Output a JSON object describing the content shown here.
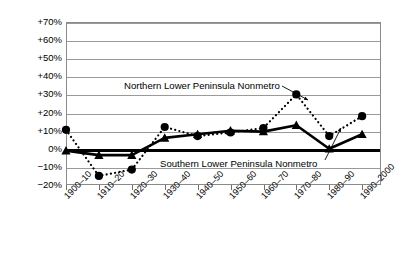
{
  "chart_data": {
    "type": "line",
    "title": "",
    "xlabel": "",
    "ylabel": "",
    "ylim": [
      -20,
      70
    ],
    "grid": true,
    "legend_position": "inline-annotations",
    "categories": [
      "1900–10",
      "1910–20",
      "1920–30",
      "1930–40",
      "1940–50",
      "1950–60",
      "1960–70",
      "1970–80",
      "1980–90",
      "1990–2000"
    ],
    "yticks": [
      "−20%",
      "−10%",
      "0%",
      "+10%",
      "+20%",
      "+30%",
      "+40%",
      "+50%",
      "+60%",
      "+70%"
    ],
    "ytick_values": [
      -20,
      -10,
      0,
      10,
      20,
      30,
      40,
      50,
      60,
      70
    ],
    "series": [
      {
        "name": "Northern Lower Peninsula Nonmetro",
        "marker": "circle",
        "line_style": "dotted",
        "values": [
          10.5,
          -15.0,
          -11.5,
          12.0,
          7.0,
          9.0,
          11.5,
          30.0,
          7.0,
          18.0
        ]
      },
      {
        "name": "Southern Lower Peninsula Nonmetro",
        "marker": "triangle",
        "line_style": "solid",
        "values": [
          -1.0,
          -3.5,
          -3.5,
          6.0,
          8.0,
          10.0,
          9.5,
          13.0,
          0.0,
          8.0
        ]
      }
    ],
    "annotations": [
      {
        "text": "Northern Lower Peninsula Nonmetro",
        "target_category": "1970–80"
      },
      {
        "text": "Southern Lower Peninsula Nonmetro",
        "target_category": "1980–90"
      }
    ],
    "colors": {
      "series": "#000000",
      "grid": "#9a9a9a",
      "axis": "#8a8a8a",
      "zero": "#000000"
    }
  }
}
